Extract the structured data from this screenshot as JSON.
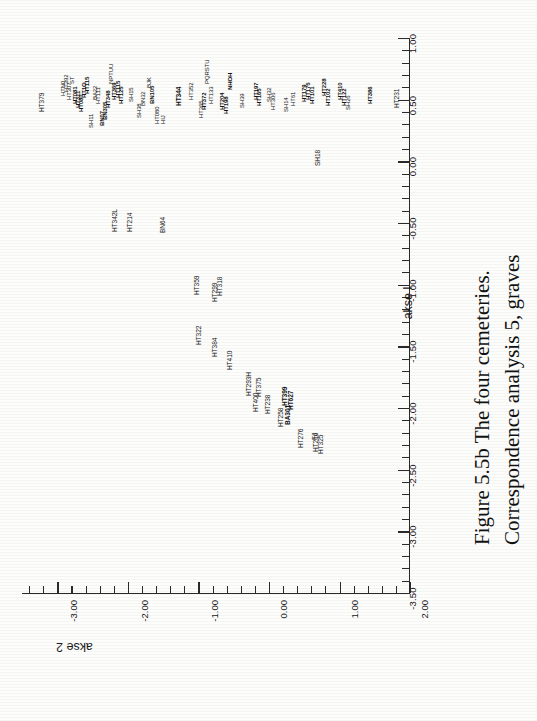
{
  "caption": {
    "line1": "Figure 5.5b  The four cemeteries.",
    "line2": "Correspondence analysis 5, graves"
  },
  "chart_data": {
    "type": "scatter",
    "orientation": "rotated-90",
    "xlabel": "akse 2",
    "ylabel": "akse 1",
    "xlim": [
      -3.5,
      2.0
    ],
    "ylim": [
      -3.5,
      1.0
    ],
    "grid": false,
    "legend": null,
    "x_ticks": [
      "2.00",
      "1.00",
      "0.00",
      "-1.00",
      "-2.00",
      "-3.00"
    ],
    "x_tick_values": [
      2.0,
      1.0,
      0.0,
      -1.0,
      -2.0,
      -3.0
    ],
    "y_ticks": [
      "1.00",
      "0.50",
      "0.00",
      "-0.50",
      "-1.00",
      "-1.50",
      "-2.00",
      "-2.50",
      "-3.00",
      "-3.50"
    ],
    "y_tick_values": [
      1.0,
      0.5,
      0.0,
      -0.5,
      -1.0,
      -1.5,
      -2.0,
      -2.5,
      -3.0,
      -3.5
    ],
    "minor_ticks_between_major": 4,
    "point_label_note": "Point labels are grave identifiers; the dense cluster overlaps heavily in the scan.",
    "points": [
      {
        "label": "HT379",
        "akse2": 1.62,
        "akse1": 0.46
      },
      {
        "label": "HTN0",
        "akse2": 1.52,
        "akse1": 0.61
      },
      {
        "label": "HT392",
        "akse2": 1.49,
        "akse1": 0.58
      },
      {
        "label": "HT307",
        "akse2": 1.46,
        "akse1": 0.55
      },
      {
        "label": "HT081",
        "akse2": 1.41,
        "akse1": 0.52
      },
      {
        "label": "HT311",
        "akse2": 1.37,
        "akse1": 0.5
      },
      {
        "label": "ST",
        "akse2": 1.44,
        "akse1": 0.64
      },
      {
        "label": "HT080",
        "akse2": 1.33,
        "akse1": 0.41
      },
      {
        "label": "SH11",
        "akse2": 1.3,
        "akse1": 0.28
      },
      {
        "label": "BA22",
        "akse2": 1.22,
        "akse1": 0.5
      },
      {
        "label": "HT111",
        "akse2": 1.25,
        "akse1": 0.46
      },
      {
        "label": "BN07",
        "akse2": 1.14,
        "akse1": 0.3
      },
      {
        "label": "BN305",
        "akse2": 1.17,
        "akse1": 0.38
      },
      {
        "label": "HT348",
        "akse2": 1.1,
        "akse1": 0.44
      },
      {
        "label": "NPTUU",
        "akse2": 1.08,
        "akse1": 0.62
      },
      {
        "label": "HT115",
        "akse2": 1.03,
        "akse1": 0.47
      },
      {
        "label": "SH15",
        "akse2": 0.96,
        "akse1": 0.42
      },
      {
        "label": "SH38",
        "akse2": 0.9,
        "akse1": 0.33
      },
      {
        "label": "BN32",
        "akse2": 0.87,
        "akse1": 0.41
      },
      {
        "label": "BJK",
        "akse2": 0.82,
        "akse1": 0.58
      },
      {
        "label": "HT080",
        "akse2": 0.79,
        "akse1": 0.27
      },
      {
        "label": "HIJ",
        "akse2": 0.76,
        "akse1": 0.3
      },
      {
        "label": "HT344",
        "akse2": 0.6,
        "akse1": 0.44
      },
      {
        "label": "HT352",
        "akse2": 0.47,
        "akse1": 0.49
      },
      {
        "label": "HT365",
        "akse2": 0.38,
        "akse1": 0.38
      },
      {
        "label": "PQRSTU",
        "akse2": 0.33,
        "akse1": 0.61
      },
      {
        "label": "HT133",
        "akse2": 0.29,
        "akse1": 0.5
      },
      {
        "label": "HT204",
        "akse2": 0.18,
        "akse1": 0.43
      },
      {
        "label": "NHOH",
        "akse2": 0.14,
        "akse1": 0.58
      },
      {
        "label": "HT113",
        "akse2": 0.1,
        "akse1": 0.4
      },
      {
        "label": "SH39",
        "akse2": 0.01,
        "akse1": 0.42
      },
      {
        "label": "HT197",
        "akse2": -0.14,
        "akse1": 0.46
      },
      {
        "label": "SH32",
        "akse2": -0.25,
        "akse1": 0.44
      },
      {
        "label": "HT306",
        "akse2": -0.29,
        "akse1": 0.4
      },
      {
        "label": "SH14",
        "akse2": -0.45,
        "akse1": 0.37
      },
      {
        "label": "HT61",
        "akse2": -0.52,
        "akse1": 0.43
      },
      {
        "label": "HT179",
        "akse2": -0.66,
        "akse1": 0.47
      },
      {
        "label": "HT175",
        "akse2": -0.7,
        "akse1": 0.5
      },
      {
        "label": "HT101",
        "akse2": -0.74,
        "akse1": 0.46
      },
      {
        "label": "HT228",
        "akse2": -0.88,
        "akse1": 0.49
      },
      {
        "label": "HT102",
        "akse2": -0.92,
        "akse1": 0.42
      },
      {
        "label": "HT410",
        "akse2": -1.05,
        "akse1": 0.48
      },
      {
        "label": "HT122",
        "akse2": -1.12,
        "akse1": 0.45
      },
      {
        "label": "SH26",
        "akse2": -1.18,
        "akse1": 0.41
      },
      {
        "label": "HT386",
        "akse2": -1.44,
        "akse1": 0.46
      },
      {
        "label": "HT231",
        "akse2": -1.8,
        "akse1": 0.44
      },
      {
        "label": "SH18",
        "akse2": -1.08,
        "akse1": 0.05
      },
      {
        "label": "HT342L",
        "akse2": 1.07,
        "akse1": -0.62
      },
      {
        "label": "HT214",
        "akse2": 1.03,
        "akse1": -0.48
      },
      {
        "label": "BN64",
        "akse2": 0.72,
        "akse1": -0.62
      },
      {
        "label": "HT359",
        "akse2": 0.32,
        "akse1": -1.28
      },
      {
        "label": "HT299",
        "akse2": 0.11,
        "akse1": -1.38
      },
      {
        "label": "HT318",
        "akse2": 0.07,
        "akse1": -1.22
      },
      {
        "label": "HT322",
        "akse2": 0.27,
        "akse1": -1.84
      },
      {
        "label": "HT384",
        "akse2": 0.12,
        "akse1": -1.96
      },
      {
        "label": "HT410",
        "akse2": -0.02,
        "akse1": -2.1
      },
      {
        "label": "HT400",
        "akse2": -0.3,
        "akse1": -2.52
      },
      {
        "label": "HT293H",
        "akse2": -0.22,
        "akse1": -2.36
      },
      {
        "label": "HT375",
        "akse2": -0.33,
        "akse1": -2.36
      },
      {
        "label": "HT238",
        "akse2": -0.42,
        "akse1": -2.54
      },
      {
        "label": "HT258",
        "akse2": -0.56,
        "akse1": -2.66
      },
      {
        "label": "BA301",
        "akse2": -0.63,
        "akse1": -2.64
      },
      {
        "label": "HT399",
        "akse2": -0.6,
        "akse1": -2.44
      },
      {
        "label": "HT627",
        "akse2": -0.66,
        "akse1": -2.48
      },
      {
        "label": "HT276",
        "akse2": -0.76,
        "akse1": -2.88
      },
      {
        "label": "HT216",
        "akse2": -0.92,
        "akse1": -2.92
      },
      {
        "label": "HT325",
        "akse2": -0.96,
        "akse1": -2.94
      },
      {
        "label": "FJ",
        "akse2": -0.9,
        "akse1": -2.78
      }
    ]
  },
  "axes": {
    "akse1": {
      "title": "akse l",
      "ticks": [
        "1.00",
        "0.50",
        "0.00",
        "-0.50",
        "-1.00",
        "-1.50",
        "-2.00",
        "-2.50",
        "-3.00",
        "-3.50"
      ]
    },
    "akse2": {
      "title": "akse 2",
      "ticks": [
        "2.00",
        "1.00",
        "0.00",
        "-1.00",
        "-2.00",
        "-3.00"
      ]
    }
  },
  "point_labels": [
    {
      "t": "HT379",
      "x": 39,
      "y": 112,
      "b": 0,
      "s": 0
    },
    {
      "t": "HTN0",
      "x": 60,
      "y": 96,
      "b": 0,
      "s": 1
    },
    {
      "t": "HT392",
      "x": 63,
      "y": 92,
      "b": 0,
      "s": 1
    },
    {
      "t": "HT307",
      "x": 66,
      "y": 100,
      "b": 0,
      "s": 1
    },
    {
      "t": "ST",
      "x": 69,
      "y": 84,
      "b": 0,
      "s": 1
    },
    {
      "t": "HT081",
      "x": 72,
      "y": 104,
      "b": 1,
      "s": 1
    },
    {
      "t": "HT311",
      "x": 75,
      "y": 108,
      "b": 1,
      "s": 1
    },
    {
      "t": "HT080",
      "x": 78,
      "y": 112,
      "b": 1,
      "s": 1
    },
    {
      "t": "HT1O",
      "x": 81,
      "y": 98,
      "b": 1,
      "s": 1
    },
    {
      "t": "HT115",
      "x": 84,
      "y": 94,
      "b": 1,
      "s": 1
    },
    {
      "t": "SH11",
      "x": 88,
      "y": 128,
      "b": 0,
      "s": 1
    },
    {
      "t": "BA22",
      "x": 92,
      "y": 100,
      "b": 0,
      "s": 1
    },
    {
      "t": "HT111",
      "x": 95,
      "y": 104,
      "b": 0,
      "s": 1
    },
    {
      "t": "BN07",
      "x": 99,
      "y": 126,
      "b": 1,
      "s": 1
    },
    {
      "t": "BN305",
      "x": 102,
      "y": 120,
      "b": 1,
      "s": 1
    },
    {
      "t": "HT348",
      "x": 105,
      "y": 108,
      "b": 1,
      "s": 1
    },
    {
      "t": "NPTUU",
      "x": 108,
      "y": 84,
      "b": 0,
      "s": 1
    },
    {
      "t": "HT369",
      "x": 111,
      "y": 100,
      "b": 1,
      "s": 1
    },
    {
      "t": "HT115",
      "x": 115,
      "y": 98,
      "b": 1,
      "s": 1
    },
    {
      "t": "HT125",
      "x": 118,
      "y": 104,
      "b": 1,
      "s": 1
    },
    {
      "t": "SH15",
      "x": 128,
      "y": 102,
      "b": 0,
      "s": 1
    },
    {
      "t": "SH38",
      "x": 136,
      "y": 118,
      "b": 0,
      "s": 1
    },
    {
      "t": "BN32",
      "x": 140,
      "y": 106,
      "b": 0,
      "s": 1
    },
    {
      "t": "BJK",
      "x": 146,
      "y": 88,
      "b": 0,
      "s": 1
    },
    {
      "t": "BN105",
      "x": 149,
      "y": 104,
      "b": 1,
      "s": 1
    },
    {
      "t": "HT080",
      "x": 154,
      "y": 124,
      "b": 0,
      "s": 1
    },
    {
      "t": "HIJ",
      "x": 160,
      "y": 124,
      "b": 0,
      "s": 1
    },
    {
      "t": "HT344",
      "x": 176,
      "y": 106,
      "b": 1,
      "s": 0
    },
    {
      "t": "HT352",
      "x": 188,
      "y": 100,
      "b": 0,
      "s": 1
    },
    {
      "t": "HT365",
      "x": 198,
      "y": 118,
      "b": 0,
      "s": 1
    },
    {
      "t": "HT372",
      "x": 201,
      "y": 110,
      "b": 1,
      "s": 1
    },
    {
      "t": "PQRSTU",
      "x": 204,
      "y": 84,
      "b": 0,
      "s": 1
    },
    {
      "t": "HT133",
      "x": 208,
      "y": 104,
      "b": 0,
      "s": 1
    },
    {
      "t": "HT204",
      "x": 219,
      "y": 110,
      "b": 1,
      "s": 1
    },
    {
      "t": "HT198",
      "x": 223,
      "y": 114,
      "b": 1,
      "s": 1
    },
    {
      "t": "NHOH",
      "x": 227,
      "y": 90,
      "b": 1,
      "s": 1
    },
    {
      "t": "SH39",
      "x": 239,
      "y": 108,
      "b": 0,
      "s": 1
    },
    {
      "t": "HT197",
      "x": 253,
      "y": 100,
      "b": 1,
      "s": 1
    },
    {
      "t": "HT165",
      "x": 256,
      "y": 106,
      "b": 1,
      "s": 1
    },
    {
      "t": "SH32",
      "x": 266,
      "y": 102,
      "b": 0,
      "s": 1
    },
    {
      "t": "HT306",
      "x": 270,
      "y": 110,
      "b": 0,
      "s": 1
    },
    {
      "t": "SH14",
      "x": 283,
      "y": 112,
      "b": 0,
      "s": 1
    },
    {
      "t": "HT61",
      "x": 290,
      "y": 106,
      "b": 0,
      "s": 1
    },
    {
      "t": "HT179",
      "x": 301,
      "y": 102,
      "b": 1,
      "s": 1
    },
    {
      "t": "HT175",
      "x": 305,
      "y": 100,
      "b": 1,
      "s": 1
    },
    {
      "t": "HT101",
      "x": 309,
      "y": 104,
      "b": 1,
      "s": 1
    },
    {
      "t": "HT228",
      "x": 321,
      "y": 96,
      "b": 1,
      "s": 1
    },
    {
      "t": "HT102",
      "x": 325,
      "y": 106,
      "b": 1,
      "s": 1
    },
    {
      "t": "HT410",
      "x": 337,
      "y": 100,
      "b": 1,
      "s": 1
    },
    {
      "t": "HT122",
      "x": 341,
      "y": 106,
      "b": 1,
      "s": 1
    },
    {
      "t": "SH26",
      "x": 345,
      "y": 110,
      "b": 0,
      "s": 1
    },
    {
      "t": "HT386",
      "x": 367,
      "y": 104,
      "b": 1,
      "s": 1
    },
    {
      "t": "HT231",
      "x": 394,
      "y": 108,
      "b": 0,
      "s": 0
    },
    {
      "t": "SH18",
      "x": 315,
      "y": 166,
      "b": 0,
      "s": 0
    },
    {
      "t": "HT342L",
      "x": 112,
      "y": 232,
      "b": 0,
      "s": 0
    },
    {
      "t": "HT214",
      "x": 127,
      "y": 232,
      "b": 0,
      "s": 0
    },
    {
      "t": "BN64",
      "x": 160,
      "y": 233,
      "b": 0,
      "s": 0
    },
    {
      "t": "HT359",
      "x": 194,
      "y": 295,
      "b": 0,
      "s": 0
    },
    {
      "t": "HT299",
      "x": 212,
      "y": 302,
      "b": 0,
      "s": 0
    },
    {
      "t": "HT318",
      "x": 217,
      "y": 296,
      "b": 0,
      "s": 0
    },
    {
      "t": "HT322",
      "x": 196,
      "y": 345,
      "b": 0,
      "s": 0
    },
    {
      "t": "HT384",
      "x": 212,
      "y": 357,
      "b": 0,
      "s": 0
    },
    {
      "t": "HT410",
      "x": 227,
      "y": 370,
      "b": 0,
      "s": 0
    },
    {
      "t": "HT400",
      "x": 253,
      "y": 412,
      "b": 0,
      "s": 0
    },
    {
      "t": "HT293H",
      "x": 246,
      "y": 396,
      "b": 0,
      "s": 0
    },
    {
      "t": "HT375",
      "x": 256,
      "y": 397,
      "b": 0,
      "s": 0
    },
    {
      "t": "HT238",
      "x": 265,
      "y": 414,
      "b": 0,
      "s": 0
    },
    {
      "t": "HT258",
      "x": 278,
      "y": 427,
      "b": 0,
      "s": 0
    },
    {
      "t": "BA301",
      "x": 285,
      "y": 425,
      "b": 1,
      "s": 0
    },
    {
      "t": "HT399",
      "x": 282,
      "y": 406,
      "b": 1,
      "s": 0
    },
    {
      "t": "HT627",
      "x": 288,
      "y": 410,
      "b": 1,
      "s": 0
    },
    {
      "t": "HT276",
      "x": 298,
      "y": 448,
      "b": 0,
      "s": 0
    },
    {
      "t": "HT216",
      "x": 313,
      "y": 452,
      "b": 0,
      "s": 0
    },
    {
      "t": "HT325",
      "x": 318,
      "y": 454,
      "b": 0,
      "s": 0
    },
    {
      "t": "FJ",
      "x": 312,
      "y": 440,
      "b": 0,
      "s": 0
    }
  ]
}
